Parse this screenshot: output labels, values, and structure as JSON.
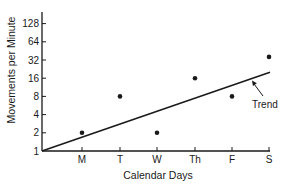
{
  "chart_data": {
    "type": "scatter",
    "title": "",
    "xlabel": "Calendar Days",
    "ylabel": "Movements per Minute",
    "yscale": "log2",
    "categories": [
      "M",
      "T",
      "W",
      "Th",
      "F",
      "S"
    ],
    "y_ticks": [
      1,
      2,
      4,
      8,
      16,
      32,
      64,
      128
    ],
    "ylim": [
      1,
      128
    ],
    "grid": false,
    "legend": null,
    "series": [
      {
        "name": "Movements per Minute",
        "type": "scatter",
        "values": [
          2,
          8,
          2,
          16,
          8,
          36
        ]
      },
      {
        "name": "Trend",
        "type": "line",
        "x": [
          "origin",
          "S"
        ],
        "values": [
          1,
          20
        ]
      }
    ],
    "annotations": [
      {
        "text": "Trend",
        "points_to": "trend-line",
        "arrow": true
      }
    ]
  },
  "layout": {
    "plot": {
      "x0": 42,
      "y_bottom": 151,
      "y_top": 12,
      "x_end": 270
    },
    "x_positions": [
      82,
      120,
      157,
      195,
      232,
      269
    ],
    "px_per_doubling": 18.2,
    "colors": {
      "ink": "#1a1a1a",
      "background": "#ffffff"
    }
  }
}
